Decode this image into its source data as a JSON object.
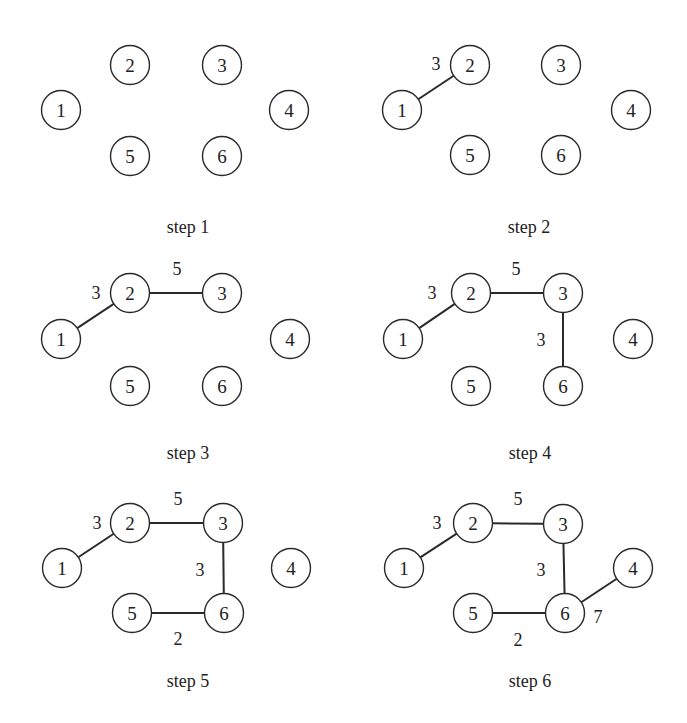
{
  "style": {
    "stroke": "#2a2a2a",
    "text": "#222222",
    "background": "#ffffff"
  },
  "node_radius": 19.5,
  "panels": [
    {
      "caption": "step 1",
      "caption_pos": [
        188,
        233
      ],
      "nodes": [
        {
          "id": "1",
          "x": 61,
          "y": 110
        },
        {
          "id": "2",
          "x": 130,
          "y": 65
        },
        {
          "id": "3",
          "x": 222,
          "y": 65
        },
        {
          "id": "4",
          "x": 289,
          "y": 110
        },
        {
          "id": "5",
          "x": 130,
          "y": 156
        },
        {
          "id": "6",
          "x": 222,
          "y": 156
        }
      ],
      "edges": []
    },
    {
      "caption": "step 2",
      "caption_pos": [
        529,
        233
      ],
      "nodes": [
        {
          "id": "1",
          "x": 402,
          "y": 110
        },
        {
          "id": "2",
          "x": 470,
          "y": 65
        },
        {
          "id": "3",
          "x": 561,
          "y": 65
        },
        {
          "id": "4",
          "x": 631,
          "y": 110
        },
        {
          "id": "5",
          "x": 470,
          "y": 155
        },
        {
          "id": "6",
          "x": 561,
          "y": 155
        }
      ],
      "edges": [
        {
          "from": "1",
          "to": "2",
          "weight": "3",
          "label_pos": [
            436,
            70
          ]
        }
      ]
    },
    {
      "caption": "step 3",
      "caption_pos": [
        188,
        459
      ],
      "nodes": [
        {
          "id": "1",
          "x": 61,
          "y": 339
        },
        {
          "id": "2",
          "x": 130,
          "y": 293
        },
        {
          "id": "3",
          "x": 222,
          "y": 293
        },
        {
          "id": "4",
          "x": 290,
          "y": 339
        },
        {
          "id": "5",
          "x": 130,
          "y": 386
        },
        {
          "id": "6",
          "x": 222,
          "y": 386
        }
      ],
      "edges": [
        {
          "from": "1",
          "to": "2",
          "weight": "3",
          "label_pos": [
            96,
            299
          ]
        },
        {
          "from": "2",
          "to": "3",
          "weight": "5",
          "label_pos": [
            177,
            275
          ]
        }
      ]
    },
    {
      "caption": "step 4",
      "caption_pos": [
        530,
        459
      ],
      "nodes": [
        {
          "id": "1",
          "x": 403,
          "y": 339
        },
        {
          "id": "2",
          "x": 471,
          "y": 293
        },
        {
          "id": "3",
          "x": 563,
          "y": 293
        },
        {
          "id": "4",
          "x": 633,
          "y": 339
        },
        {
          "id": "5",
          "x": 471,
          "y": 386
        },
        {
          "id": "6",
          "x": 563,
          "y": 386
        }
      ],
      "edges": [
        {
          "from": "1",
          "to": "2",
          "weight": "3",
          "label_pos": [
            432,
            299
          ]
        },
        {
          "from": "2",
          "to": "3",
          "weight": "5",
          "label_pos": [
            516,
            275
          ]
        },
        {
          "from": "3",
          "to": "6",
          "weight": "3",
          "label_pos": [
            541,
            346
          ]
        }
      ]
    },
    {
      "caption": "step 5",
      "caption_pos": [
        188,
        687
      ],
      "nodes": [
        {
          "id": "1",
          "x": 62,
          "y": 568
        },
        {
          "id": "2",
          "x": 130,
          "y": 523
        },
        {
          "id": "3",
          "x": 223,
          "y": 523
        },
        {
          "id": "4",
          "x": 291,
          "y": 568
        },
        {
          "id": "5",
          "x": 132,
          "y": 613
        },
        {
          "id": "6",
          "x": 224,
          "y": 613
        }
      ],
      "edges": [
        {
          "from": "1",
          "to": "2",
          "weight": "3",
          "label_pos": [
            97,
            529
          ]
        },
        {
          "from": "2",
          "to": "3",
          "weight": "5",
          "label_pos": [
            178,
            505
          ]
        },
        {
          "from": "3",
          "to": "6",
          "weight": "3",
          "label_pos": [
            200,
            576
          ]
        },
        {
          "from": "5",
          "to": "6",
          "weight": "2",
          "label_pos": [
            178,
            645
          ]
        }
      ]
    },
    {
      "caption": "step 6",
      "caption_pos": [
        530,
        687
      ],
      "nodes": [
        {
          "id": "1",
          "x": 404,
          "y": 568
        },
        {
          "id": "2",
          "x": 473,
          "y": 523
        },
        {
          "id": "3",
          "x": 563,
          "y": 524
        },
        {
          "id": "4",
          "x": 633,
          "y": 568
        },
        {
          "id": "5",
          "x": 473,
          "y": 613
        },
        {
          "id": "6",
          "x": 565,
          "y": 613
        }
      ],
      "edges": [
        {
          "from": "1",
          "to": "2",
          "weight": "3",
          "label_pos": [
            437,
            529
          ]
        },
        {
          "from": "2",
          "to": "3",
          "weight": "5",
          "label_pos": [
            518,
            505
          ]
        },
        {
          "from": "3",
          "to": "6",
          "weight": "3",
          "label_pos": [
            541,
            576
          ]
        },
        {
          "from": "5",
          "to": "6",
          "weight": "2",
          "label_pos": [
            518,
            646
          ]
        },
        {
          "from": "6",
          "to": "4",
          "weight": "7",
          "label_pos": [
            598,
            623
          ]
        }
      ]
    }
  ]
}
